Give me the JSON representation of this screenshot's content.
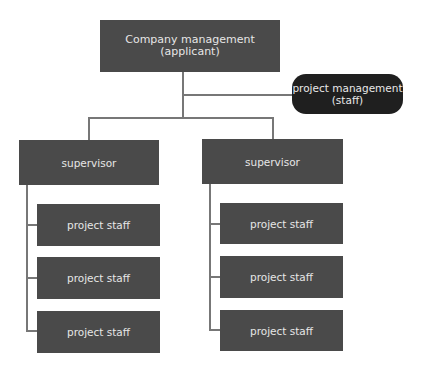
{
  "root": {
    "label_line1": "Company management",
    "label_line2": "(applicant)"
  },
  "side": {
    "label_line1": "project management",
    "label_line2": "(staff)"
  },
  "branches": [
    {
      "supervisor": "supervisor",
      "staff": [
        "project staff",
        "project staff",
        "project staff"
      ]
    },
    {
      "supervisor": "supervisor",
      "staff": [
        "project staff",
        "project staff",
        "project staff"
      ]
    }
  ],
  "colors": {
    "box": "#4a4a4a",
    "pill": "#1f1f1f",
    "line": "#777777",
    "text": "#e6e6e6"
  }
}
